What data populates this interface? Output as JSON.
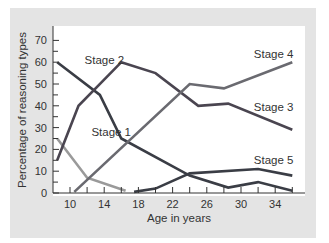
{
  "chart_data": {
    "type": "line",
    "title": "",
    "xlabel": "Age in years",
    "ylabel": "Percentage of reasoning types",
    "xlim": [
      8,
      37
    ],
    "ylim": [
      0,
      75
    ],
    "x_ticks": [
      10,
      12,
      14,
      16,
      18,
      20,
      22,
      24,
      26,
      28,
      30,
      32,
      34,
      36
    ],
    "x_tick_labels": [
      "10",
      "14",
      "18",
      "22",
      "26",
      "30",
      "34"
    ],
    "y_ticks": [
      0,
      5,
      10,
      15,
      20,
      25,
      30,
      35,
      40,
      45,
      50,
      55,
      60,
      65,
      70
    ],
    "y_tick_labels": [
      "0",
      "10",
      "20",
      "30",
      "40",
      "50",
      "60",
      "70"
    ],
    "grid": false,
    "legend": "inline labels",
    "series": [
      {
        "name": "Stage 1",
        "color": "#9a9a9a",
        "points": [
          [
            8.5,
            25
          ],
          [
            12,
            7
          ],
          [
            16.5,
            1
          ]
        ]
      },
      {
        "name": "Stage 2",
        "color": "#3a3d45",
        "points": [
          [
            8.5,
            60
          ],
          [
            13.5,
            45
          ],
          [
            16,
            25
          ],
          [
            24,
            8
          ],
          [
            28.5,
            2.5
          ],
          [
            32,
            5
          ],
          [
            36,
            1
          ]
        ]
      },
      {
        "name": "Stage 3",
        "color": "#4a4550",
        "points": [
          [
            8.5,
            15
          ],
          [
            11,
            40
          ],
          [
            16,
            60
          ],
          [
            20,
            55
          ],
          [
            25,
            40
          ],
          [
            28.5,
            41
          ],
          [
            36,
            29
          ]
        ]
      },
      {
        "name": "Stage 4",
        "color": "#6a6a70",
        "points": [
          [
            10.5,
            0.5
          ],
          [
            24,
            50
          ],
          [
            28,
            48
          ],
          [
            36,
            60
          ]
        ]
      },
      {
        "name": "Stage 5",
        "color": "#3a3d45",
        "points": [
          [
            17.5,
            0.5
          ],
          [
            20,
            2
          ],
          [
            24,
            9
          ],
          [
            32,
            11
          ],
          [
            36,
            8
          ]
        ]
      }
    ],
    "annotations": [
      {
        "text": "Stage 1",
        "series": "Stage 1"
      },
      {
        "text": "Stage 2",
        "series": "Stage 2"
      },
      {
        "text": "Stage 3",
        "series": "Stage 3"
      },
      {
        "text": "Stage 4",
        "series": "Stage 4"
      },
      {
        "text": "Stage 5",
        "series": "Stage 5"
      }
    ]
  }
}
